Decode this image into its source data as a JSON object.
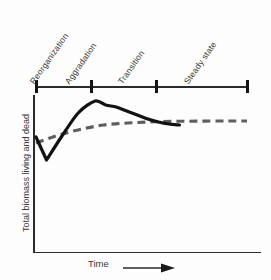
{
  "chart_data": {
    "type": "line",
    "title": "",
    "subtitle": "",
    "xlabel": "Time",
    "ylabel": "Total biomass living and dead",
    "xlim": [
      0,
      1
    ],
    "ylim": [
      0,
      1
    ],
    "grid": false,
    "legend_position": "none",
    "annotations": {
      "phases": [
        {
          "label": "Reorganization",
          "tick_x": 35
        },
        {
          "label": "Aggradation",
          "tick_x": 90
        },
        {
          "label": "Transition",
          "tick_x": 155
        },
        {
          "label": "Steady state",
          "tick_x": 247
        }
      ],
      "phase_axis_note": "upper horizontal timeline with 4 tick marks delimiting successional stages"
    },
    "series": [
      {
        "name": "Total biomass living and dead",
        "style": "solid",
        "color": "#121212",
        "description": "Sharp initial decline, rapid rise to an overshoot peak, decline through transition, then damped oscillation about the steady state asymptote",
        "x": [
          0.0,
          0.05,
          0.12,
          0.2,
          0.28,
          0.33,
          0.38,
          0.43,
          0.48,
          0.53,
          0.58,
          0.63,
          0.68,
          0.72,
          0.76,
          0.8,
          0.84,
          0.88,
          0.92,
          0.96,
          1.0
        ],
        "y": [
          0.62,
          0.39,
          0.62,
          0.86,
          0.98,
          0.94,
          0.92,
          0.88,
          0.84,
          0.8,
          0.77,
          0.75,
          0.74,
          0.76,
          0.73,
          0.77,
          0.73,
          0.77,
          0.73,
          0.77,
          0.75
        ]
      },
      {
        "name": "Asymptotic trend",
        "style": "dashed",
        "color": "#5e5e5e",
        "description": "Smooth monotonic saturating curve rising to the same steady state level",
        "x": [
          0.0,
          0.08,
          0.16,
          0.24,
          0.32,
          0.4,
          0.48,
          0.56,
          0.64,
          0.72,
          0.8,
          0.88,
          0.94,
          1.0
        ],
        "y": [
          0.56,
          0.62,
          0.67,
          0.71,
          0.74,
          0.755,
          0.765,
          0.772,
          0.776,
          0.778,
          0.779,
          0.78,
          0.78,
          0.78
        ]
      }
    ]
  },
  "axes": {
    "y_label": "Total biomass living and dead",
    "x_label": "Time"
  },
  "phases": {
    "reorganization": "Reorganization",
    "aggradation": "Aggradation",
    "transition": "Transition",
    "steady_state": "Steady state"
  }
}
